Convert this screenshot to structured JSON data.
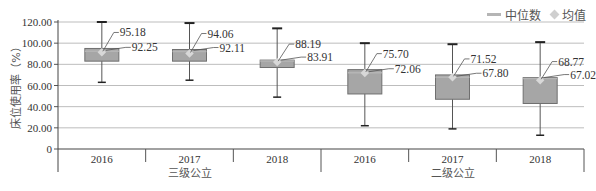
{
  "chart_data": {
    "type": "boxplot",
    "title": "",
    "xlabel": "",
    "ylabel": "床位使用率（%）",
    "ylim": [
      0,
      120
    ],
    "yticks": [
      "0",
      "20.00",
      "40.00",
      "60.00",
      "80.00",
      "100.00",
      "120.00"
    ],
    "grid": true,
    "legend_position": "top-right",
    "legend": [
      {
        "label": "中位数",
        "marker": "line",
        "color": "#b5b5b5"
      },
      {
        "label": "均值",
        "marker": "diamond",
        "color": "#cfcfcf"
      }
    ],
    "groups": [
      {
        "label": "三级公立",
        "categories": [
          "2016",
          "2017",
          "2018"
        ]
      },
      {
        "label": "二级公立",
        "categories": [
          "2016",
          "2017",
          "2018"
        ]
      }
    ],
    "categories": [
      "2016",
      "2017",
      "2018",
      "2016",
      "2017",
      "2018"
    ],
    "series": [
      {
        "group": "三级公立",
        "year": "2016",
        "whisker_high": 120,
        "q3": 95,
        "q1": 83,
        "whisker_low": 63,
        "mean": 95.18,
        "median": 92.25
      },
      {
        "group": "三级公立",
        "year": "2017",
        "whisker_high": 119,
        "q3": 94,
        "q1": 83,
        "whisker_low": 65,
        "mean": 94.06,
        "median": 92.11
      },
      {
        "group": "三级公立",
        "year": "2018",
        "whisker_high": 114,
        "q3": 84,
        "q1": 77,
        "whisker_low": 49,
        "mean": 88.19,
        "median": 83.91
      },
      {
        "group": "二级公立",
        "year": "2016",
        "whisker_high": 100,
        "q3": 75,
        "q1": 52,
        "whisker_low": 22,
        "mean": 75.7,
        "median": 72.06
      },
      {
        "group": "二级公立",
        "year": "2017",
        "whisker_high": 99,
        "q3": 70,
        "q1": 47,
        "whisker_low": 19,
        "mean": 71.52,
        "median": 67.8
      },
      {
        "group": "二级公立",
        "year": "2018",
        "whisker_high": 101,
        "q3": 67.5,
        "q1": 43,
        "whisker_low": 13,
        "mean": 68.77,
        "median": 67.02
      }
    ],
    "annotations": [
      {
        "text": "95.18"
      },
      {
        "text": "92.25"
      },
      {
        "text": "94.06"
      },
      {
        "text": "92.11"
      },
      {
        "text": "88.19"
      },
      {
        "text": "83.91"
      },
      {
        "text": "75.70"
      },
      {
        "text": "72.06"
      },
      {
        "text": "71.52"
      },
      {
        "text": "67.80"
      },
      {
        "text": "68.77"
      },
      {
        "text": "67.02"
      }
    ],
    "colors": {
      "box_fill": "#a6a6a6",
      "box_stroke": "#6f6f6f",
      "grid": "#bdbdbd",
      "whisker": "#555555"
    }
  }
}
